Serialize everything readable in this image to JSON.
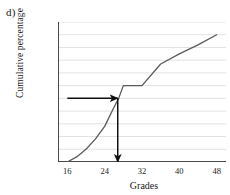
{
  "panel": {
    "label": "d)"
  },
  "chart_data": {
    "type": "line",
    "title": "",
    "xlabel": "Grades",
    "ylabel": "Cumulative percentage",
    "xlim": [
      14,
      50
    ],
    "ylim": [
      0,
      110
    ],
    "xticks": [
      16,
      24,
      32,
      40,
      48
    ],
    "yticks": [
      0,
      10,
      20,
      30,
      40,
      50,
      60,
      70,
      80,
      90,
      100,
      110
    ],
    "grid": true,
    "grid_axis": "y",
    "legend": "none",
    "series": [
      {
        "name": "Cumulative percentage ogive",
        "x": [
          16,
          18,
          20,
          22,
          24,
          26,
          27,
          28,
          32,
          36,
          40,
          44,
          48
        ],
        "y": [
          0,
          4,
          10,
          18,
          28,
          43,
          50,
          60,
          60,
          77,
          85,
          92,
          100
        ]
      }
    ],
    "annotations": [
      {
        "name": "median-horizontal-arrow",
        "kind": "arrow",
        "from": {
          "x": 16,
          "y": 50
        },
        "to": {
          "x": 26.8,
          "y": 50
        },
        "value": 50,
        "color": "#111111"
      },
      {
        "name": "median-vertical-arrow",
        "kind": "arrow",
        "from": {
          "x": 26.8,
          "y": 50
        },
        "to": {
          "x": 26.8,
          "y": 0
        },
        "value": 26.8,
        "color": "#111111"
      }
    ],
    "colors": {
      "curve": "#5a5a5a",
      "grid": "#e2e2e2",
      "axis": "#4a4a4a",
      "annotation": "#111111",
      "background": "#ffffff"
    }
  }
}
